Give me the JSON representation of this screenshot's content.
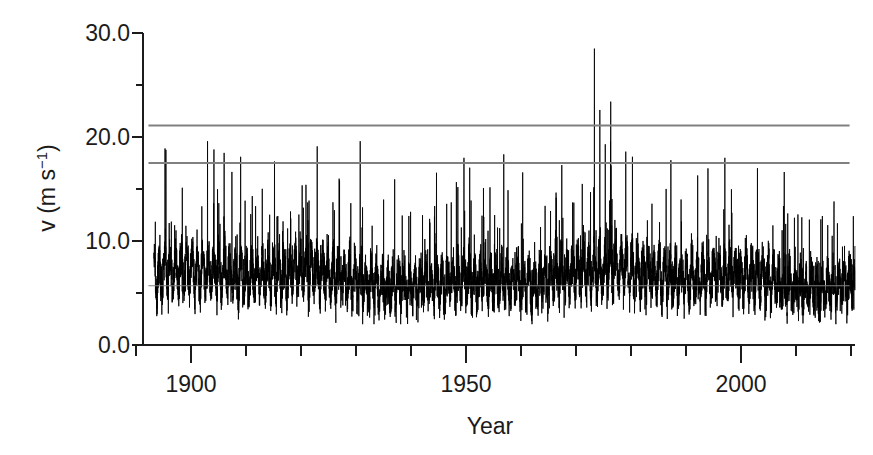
{
  "figure": {
    "name": "wind-speed-time-series",
    "background_color": "#ffffff",
    "series_color": "#000000",
    "reference_line_color": "#808080",
    "axis_color": "#1b1b1b"
  },
  "axes": {
    "x": {
      "label": "Year",
      "tick_labels": [
        "1900",
        "1950",
        "2000"
      ],
      "tick_values": [
        1900,
        1950,
        2000
      ],
      "minor_tick_step": 10,
      "range": [
        1890,
        2021
      ]
    },
    "y": {
      "label_parts": {
        "main": "v (m s",
        "exponent": "−1",
        "close": ")"
      },
      "label_plain": "v (m s−1)",
      "tick_labels": [
        "0.0",
        "10.0",
        "20.0",
        "30.0"
      ],
      "tick_values": [
        0,
        10,
        20,
        30
      ],
      "minor_tick_values": [
        5,
        15,
        25
      ],
      "range": [
        0,
        30
      ]
    }
  },
  "chart_data": {
    "type": "line",
    "title": "",
    "xlabel": "Year",
    "ylabel": "v (m s−1)",
    "xlim": [
      1890,
      2021
    ],
    "ylim": [
      0,
      30
    ],
    "xticks": [
      1900,
      1950,
      2000
    ],
    "yticks": [
      0,
      10,
      20,
      30
    ],
    "xminor_ticks": [
      1890,
      1910,
      1920,
      1930,
      1940,
      1960,
      1970,
      1980,
      1990,
      2010,
      2020
    ],
    "yminor_ticks": [
      5,
      15,
      25
    ],
    "grid": false,
    "legend": "none",
    "series": [
      {
        "name": "wind speed (daily/sub-daily maxima)",
        "color": "#000000",
        "description": "Dense high-frequency wind speed record spanning 1892-2020; baseline fluctuating roughly 2.5-11 m/s with frequent spikes to 14-19 m/s and rare extremes up to 28.5 m/s.",
        "x_start": 1892,
        "x_end": 2020,
        "y_typical_min": 2.5,
        "y_typical_max": 11.5,
        "y_spike_max": 28.5,
        "max_event": {
          "year": 1973,
          "value": 28.5
        }
      }
    ],
    "reference_lines": [
      {
        "name": "upper-threshold",
        "value": 21.1,
        "color": "#808080",
        "x_start": 1891,
        "x_end": 2020
      },
      {
        "name": "middle-threshold",
        "value": 17.5,
        "color": "#808080",
        "x_start": 1891,
        "x_end": 2020
      },
      {
        "name": "lower-threshold",
        "value": 5.7,
        "color": "#808080",
        "x_start": 1891,
        "x_end": 2020
      }
    ],
    "notable_peaks": [
      {
        "year": 1973,
        "value": 28.5
      },
      {
        "year": 1976,
        "value": 23.4
      },
      {
        "year": 1974,
        "value": 22.6
      },
      {
        "year": 1922,
        "value": 19.1
      },
      {
        "year": 1903,
        "value": 18.8
      },
      {
        "year": 1975,
        "value": 19.3
      },
      {
        "year": 1980,
        "value": 18.1
      },
      {
        "year": 1949,
        "value": 18.0
      },
      {
        "year": 1997,
        "value": 18.0
      },
      {
        "year": 2003,
        "value": 17.0
      },
      {
        "year": 1967,
        "value": 17.3
      },
      {
        "year": 1894,
        "value": 18.9
      }
    ]
  }
}
